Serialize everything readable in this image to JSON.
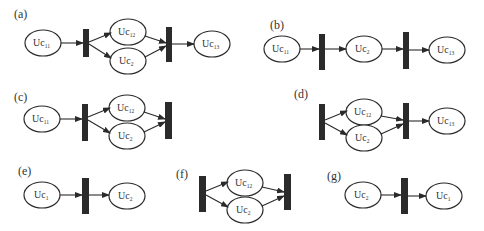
{
  "figure": {
    "type": "petri-net-subfigures",
    "colors": {
      "stroke": "#2a2a2a",
      "transition_bar": "#2b2b2b",
      "background": "#ffffff",
      "text": "#333333"
    },
    "panels": [
      {
        "id": "a",
        "label": "(a)",
        "places": [
          {
            "id": "p1",
            "base": "Uc",
            "sub": "11"
          },
          {
            "id": "p2",
            "base": "Uc",
            "sub": "12"
          },
          {
            "id": "p3",
            "base": "Uc",
            "sub": "2"
          },
          {
            "id": "p4",
            "base": "Uc",
            "sub": "13"
          }
        ],
        "transitions": [
          "t1",
          "t2"
        ],
        "arcs": [
          [
            "p1",
            "t1"
          ],
          [
            "t1",
            "p2"
          ],
          [
            "t1",
            "p3"
          ],
          [
            "p2",
            "t2"
          ],
          [
            "p3",
            "t2"
          ],
          [
            "t2",
            "p4"
          ]
        ]
      },
      {
        "id": "b",
        "label": "(b)",
        "places": [
          {
            "id": "p1",
            "base": "Uc",
            "sub": "11"
          },
          {
            "id": "p2",
            "base": "Uc",
            "sub": "2"
          },
          {
            "id": "p3",
            "base": "Uc",
            "sub": "13"
          }
        ],
        "transitions": [
          "t1",
          "t2"
        ],
        "arcs": [
          [
            "p1",
            "t1"
          ],
          [
            "t1",
            "p2"
          ],
          [
            "p2",
            "t2"
          ],
          [
            "t2",
            "p3"
          ]
        ]
      },
      {
        "id": "c",
        "label": "(c)",
        "places": [
          {
            "id": "p1",
            "base": "Uc",
            "sub": "11"
          },
          {
            "id": "p2",
            "base": "Uc",
            "sub": "12"
          },
          {
            "id": "p3",
            "base": "Uc",
            "sub": "2"
          }
        ],
        "transitions": [
          "t1",
          "t2"
        ],
        "arcs": [
          [
            "p1",
            "t1"
          ],
          [
            "t1",
            "p2"
          ],
          [
            "t1",
            "p3"
          ],
          [
            "p2",
            "t2"
          ],
          [
            "p3",
            "t2"
          ]
        ]
      },
      {
        "id": "d",
        "label": "(d)",
        "places": [
          {
            "id": "p1",
            "base": "Uc",
            "sub": "12"
          },
          {
            "id": "p2",
            "base": "Uc",
            "sub": "2"
          },
          {
            "id": "p3",
            "base": "Uc",
            "sub": "13"
          }
        ],
        "transitions": [
          "t1",
          "t2"
        ],
        "arcs": [
          [
            "t1",
            "p1"
          ],
          [
            "t1",
            "p2"
          ],
          [
            "p1",
            "t2"
          ],
          [
            "p2",
            "t2"
          ],
          [
            "t2",
            "p3"
          ]
        ]
      },
      {
        "id": "e",
        "label": "(e)",
        "places": [
          {
            "id": "p1",
            "base": "Uc",
            "sub": "1"
          },
          {
            "id": "p2",
            "base": "Uc",
            "sub": "2"
          }
        ],
        "transitions": [
          "t1"
        ],
        "arcs": [
          [
            "p1",
            "t1"
          ],
          [
            "t1",
            "p2"
          ]
        ]
      },
      {
        "id": "f",
        "label": "(f)",
        "places": [
          {
            "id": "p1",
            "base": "Uc",
            "sub": "12"
          },
          {
            "id": "p2",
            "base": "Uc",
            "sub": "2"
          }
        ],
        "transitions": [
          "t1",
          "t2"
        ],
        "arcs": [
          [
            "t1",
            "p1"
          ],
          [
            "t1",
            "p2"
          ],
          [
            "p1",
            "t2"
          ],
          [
            "p2",
            "t2"
          ]
        ]
      },
      {
        "id": "g",
        "label": "(g)",
        "places": [
          {
            "id": "p1",
            "base": "Uc",
            "sub": "2"
          },
          {
            "id": "p2",
            "base": "Uc",
            "sub": "1"
          }
        ],
        "transitions": [
          "t1"
        ],
        "arcs": [
          [
            "p1",
            "t1"
          ],
          [
            "t1",
            "p2"
          ]
        ]
      }
    ]
  }
}
